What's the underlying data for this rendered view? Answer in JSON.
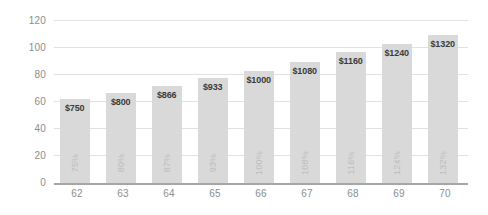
{
  "chart_data": {
    "type": "bar",
    "title": "",
    "subtitle": "",
    "xlabel": "",
    "ylabel": "",
    "categories": [
      "62",
      "63",
      "64",
      "65",
      "66",
      "67",
      "68",
      "69",
      "70"
    ],
    "values": [
      62,
      67,
      72,
      78,
      83,
      90,
      97,
      103,
      110
    ],
    "value_labels": [
      "$750",
      "$800",
      "$866",
      "$933",
      "$1000",
      "$1080",
      "$1160",
      "$1240",
      "$1320"
    ],
    "percent_labels": [
      "75%",
      "80%",
      "87%",
      "93%",
      "100%",
      "108%",
      "116%",
      "124%",
      "132%"
    ],
    "ylim": [
      0,
      120
    ],
    "yticks": [
      "0",
      "20",
      "40",
      "60",
      "80",
      "100",
      "120"
    ],
    "ytick_values": [
      0,
      20,
      40,
      60,
      80,
      100,
      120
    ],
    "grid": true,
    "legend": "none",
    "colors": {
      "bar_fill": "#d9d9d9",
      "gridline": "#e2e2e2",
      "axis_line": "#a6a6a6",
      "tick_label": "#8d8d8d",
      "value_label": "#3b3b3b",
      "percent_label": "#bdbdbd",
      "background": "#ffffff"
    }
  }
}
